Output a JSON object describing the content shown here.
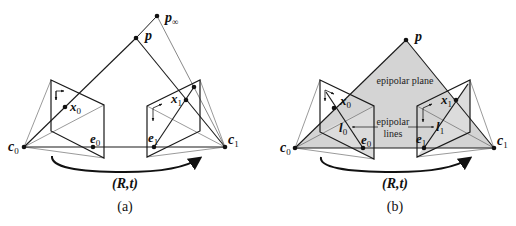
{
  "panels": [
    {
      "id": "a",
      "caption": "(a)",
      "motion_label": "(R,t)",
      "points": {
        "c0": {
          "label": "c",
          "sub": "0"
        },
        "c1": {
          "label": "c",
          "sub": "1"
        },
        "p": {
          "label": "p"
        },
        "p_inf": {
          "label": "p",
          "sub": "∞"
        },
        "x0": {
          "label": "x",
          "sub": "0"
        },
        "x1": {
          "label": "x",
          "sub": "1"
        },
        "e0": {
          "label": "e",
          "sub": "0"
        },
        "e1": {
          "label": "e",
          "sub": "1"
        }
      }
    },
    {
      "id": "b",
      "caption": "(b)",
      "motion_label": "(R,t)",
      "plane_label": "epipolar plane",
      "lines_label_1": "epipolar",
      "lines_label_2": "lines",
      "points": {
        "c0": {
          "label": "c",
          "sub": "0"
        },
        "c1": {
          "label": "c",
          "sub": "1"
        },
        "p": {
          "label": "p"
        },
        "x0": {
          "label": "x",
          "sub": "0"
        },
        "x1": {
          "label": "x",
          "sub": "1"
        },
        "e0": {
          "label": "e",
          "sub": "0"
        },
        "e1": {
          "label": "e",
          "sub": "1"
        },
        "l0": {
          "label": "l",
          "sub": "0"
        },
        "l1": {
          "label": "l",
          "sub": "1"
        }
      }
    }
  ],
  "colors": {
    "line": "#1a1a1a",
    "thin_line": "#555555",
    "plane_fill": "#d4d4d4"
  }
}
